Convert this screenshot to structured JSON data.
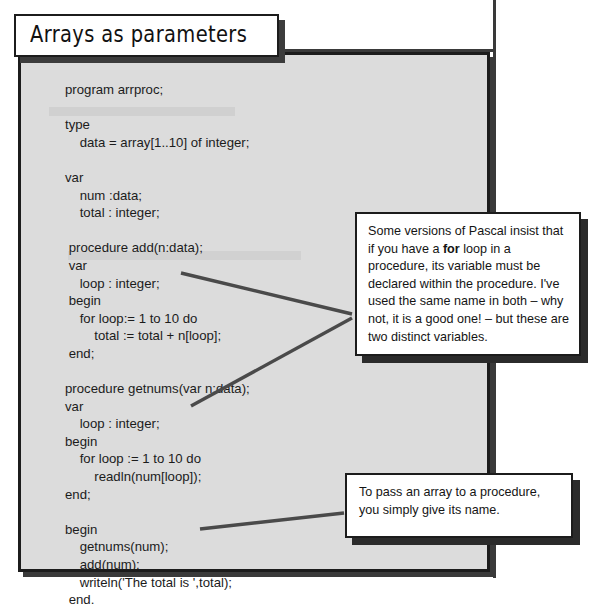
{
  "page": {
    "title": "Arrays as parameters",
    "background_color": "#ffffff",
    "panel_color": "#dcdcdc",
    "ink_color": "#1c1c1c"
  },
  "code": {
    "language": "Pascal",
    "lines": [
      "program arrproc;",
      "",
      "type",
      "    data = array[1..10] of integer;",
      "",
      "var",
      "    num :data;",
      "    total : integer;",
      "",
      " procedure add(n:data);",
      " var",
      "    loop : integer;",
      " begin",
      "    for loop:= 1 to 10 do",
      "        total := total + n[loop];",
      " end;",
      "",
      "procedure getnums(var n:data);",
      "var",
      "    loop : integer;",
      "begin",
      "    for loop := 1 to 10 do",
      "        readln(num[loop]);",
      "end;",
      "",
      "begin",
      "    getnums(num);",
      "    add(num);",
      "    writeln('The total is ',total);",
      " end."
    ]
  },
  "callouts": [
    {
      "id": "pascal-note",
      "text_before_bold": "Some versions of Pascal insist that if you have a ",
      "bold_word": "for",
      "text_after_bold": " loop in a procedure, its variable must be declared within the procedure. I've used the same name in both – why not, it is a good one! – but these are two distinct variables."
    },
    {
      "id": "array-note",
      "text": "To pass an array to a procedure, you simply give its name."
    }
  ]
}
